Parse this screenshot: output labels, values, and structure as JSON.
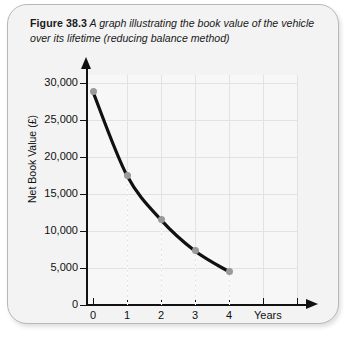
{
  "caption": {
    "figure_number": "Figure 38.3",
    "text": " A graph illustrating the book value of the vehicle over its lifetime (reducing balance method)"
  },
  "chart_data": {
    "type": "line",
    "title": "A graph illustrating the book value of the vehicle over its lifetime (reducing balance method)",
    "xlabel": "Years",
    "ylabel": "Net Book Value (£)",
    "x": [
      0,
      1,
      2,
      3,
      4
    ],
    "values": [
      28800,
      17500,
      11500,
      7300,
      4500
    ],
    "xlim": [
      0,
      6
    ],
    "ylim": [
      0,
      31500
    ],
    "grid": true,
    "legend": "none",
    "x_ticks": [
      "0",
      "1",
      "2",
      "3",
      "4",
      "",
      ""
    ],
    "x_tick_values": [
      0,
      1,
      2,
      3,
      4,
      5,
      6
    ],
    "y_ticks": [
      "0",
      "5,000",
      "10,000",
      "15,000",
      "20,000",
      "25,000",
      "30,000"
    ],
    "y_tick_values": [
      0,
      5000,
      10000,
      15000,
      20000,
      25000,
      30000
    ],
    "marker_color": "#9a9a9a",
    "line_color": "#111111",
    "grid_color": "#e2e2e2",
    "plot_background": "#f7f7f7"
  },
  "panel": {
    "background": "#f3f3f3",
    "border_color": "#b8b8b8"
  }
}
